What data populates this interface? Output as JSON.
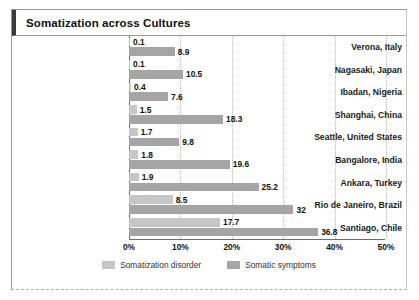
{
  "title": "Somatization across Cultures",
  "legend": {
    "position": "bottom-center",
    "items": [
      {
        "label": "Somatization disorder",
        "color": "#c6c6c6",
        "swatch": "light"
      },
      {
        "label": "Somatic symptoms",
        "color": "#a5a5a5",
        "swatch": "dark"
      }
    ]
  },
  "axis": {
    "ticks": [
      "0%",
      "10%",
      "20%",
      "30%",
      "40%",
      "50%"
    ],
    "tick_values": [
      0,
      10,
      20,
      30,
      40,
      50
    ],
    "min": 0,
    "max": 50
  },
  "chart_data": {
    "type": "bar",
    "orientation": "horizontal",
    "title": "Somatization across Cultures",
    "xlabel": "",
    "ylabel": "",
    "xlim": [
      0,
      50
    ],
    "grid": true,
    "legend_position": "bottom-center",
    "categories": [
      "Verona, Italy",
      "Nagasaki, Japan",
      "Ibadan, Nigeria",
      "Shanghai, China",
      "Seattle, United States",
      "Bangalore, India",
      "Ankara, Turkey",
      "Rio de Janeiro, Brazil",
      "Santiago, Chile"
    ],
    "series": [
      {
        "name": "Somatization disorder",
        "color": "#c6c6c6",
        "values": [
          0.1,
          0.1,
          0.4,
          1.5,
          1.7,
          1.8,
          1.9,
          8.5,
          17.7
        ],
        "labels": [
          "0.1",
          "0.1",
          "0.4",
          "1.5",
          "1.7",
          "1.8",
          "1.9",
          "8.5",
          "17.7"
        ]
      },
      {
        "name": "Somatic symptoms",
        "color": "#a5a5a5",
        "values": [
          8.9,
          10.5,
          7.6,
          18.3,
          9.8,
          19.6,
          25.2,
          32,
          36.8
        ],
        "labels": [
          "8.9",
          "10.5",
          "7.6",
          "18.3",
          "9.8",
          "19.6",
          "25.2",
          "32",
          "36.8"
        ]
      }
    ]
  }
}
